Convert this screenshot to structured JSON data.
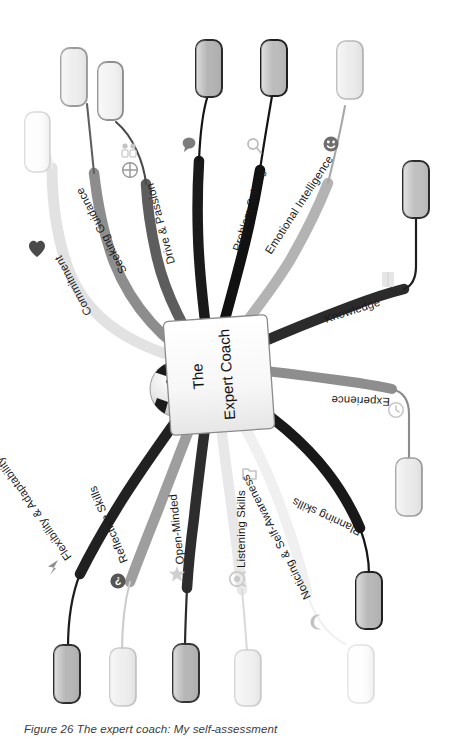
{
  "figure": {
    "caption": "Figure 26 The expert coach: My self-assessment",
    "caption_number": "Figure 26",
    "caption_text": "The expert coach: My self-assessment",
    "rotation_degrees": 90,
    "background_color": "#ffffff"
  },
  "center": {
    "title_line1": "The",
    "title_line2": "Expert Coach",
    "full_title": "The Expert Coach",
    "icon": "soccer-ball-icon",
    "fill_color": "#f4f4f4",
    "border_color": "#8a8a8a",
    "text_color": "#111111"
  },
  "branches": [
    {
      "id": "commitment",
      "label": "Commitment",
      "icon": "heart-icon",
      "icon_color": "#4a4a4a",
      "branch_color": "#e2e2e2",
      "node": {
        "fill": "#fdfdfd",
        "border": "#d8d8d8",
        "value": ""
      }
    },
    {
      "id": "seeking-guidance",
      "label": "Seeking Guidance",
      "icon": "people-group-icon",
      "icon_color": "#d0d0d0",
      "branch_color": "#8d8d8d",
      "node": {
        "fill": "#eeeeee",
        "border": "#9a9a9a",
        "value": ""
      }
    },
    {
      "id": "drive-and-passion",
      "label": "Drive & Passion",
      "icon": "target-crosshair-icon",
      "icon_color": "#9a9a9a",
      "branch_color": "#5d5d5d",
      "node": {
        "fill": "#f2f2f2",
        "border": "#8e8e8e",
        "value": ""
      }
    },
    {
      "id": "communication",
      "label": "Communication",
      "icon": "speech-bubble-icon",
      "icon_color": "#7c7c7c",
      "branch_color": "#1a1a1a",
      "node": {
        "fill": "#b4b4b4",
        "border": "#2a2a2a",
        "value": ""
      }
    },
    {
      "id": "problem-solving",
      "label": "Problem Solving",
      "icon": "magnifier-icon",
      "icon_color": "#bdbdbd",
      "branch_color": "#111111",
      "node": {
        "fill": "#bcbcbc",
        "border": "#1d1d1d",
        "value": ""
      }
    },
    {
      "id": "emotional-intelligence",
      "label": "Emotional Intelligence",
      "icon": "smiley-face-icon",
      "icon_color": "#6e6e6e",
      "branch_color": "#b3b3b3",
      "node": {
        "fill": "#ececec",
        "border": "#b6b6b6",
        "value": ""
      }
    },
    {
      "id": "knowledge",
      "label": "Knowledge",
      "icon": "book-icon",
      "icon_color": "#e0e0e0",
      "branch_color": "#2b2b2b",
      "node": {
        "fill": "#c0c0c0",
        "border": "#2b2b2b",
        "value": ""
      }
    },
    {
      "id": "experience",
      "label": "Experience",
      "icon": "clock-icon",
      "icon_color": "#c9c9c9",
      "branch_color": "#8e8e8e",
      "node": {
        "fill": "#ebebeb",
        "border": "#9d9d9d",
        "value": ""
      }
    },
    {
      "id": "planning-skills",
      "label": "Planning skills",
      "icon": "folder-icon",
      "icon_color": "#c4c4c4",
      "branch_color": "#181818",
      "node": {
        "fill": "#b8b8b8",
        "border": "#1f1f1f",
        "value": ""
      }
    },
    {
      "id": "noticing-and-self-awareness",
      "label": "Noticing & Self-Awareness",
      "icon": "moon-icon",
      "icon_color": "#c2c2c2",
      "branch_color": "#f0f0f0",
      "node": {
        "fill": "#fefefe",
        "border": "#e2e2e2",
        "value": ""
      }
    },
    {
      "id": "listening-skills",
      "label": "Listening Skills",
      "icon": "ear-listening-icon",
      "icon_color": "#c9c9c9",
      "branch_color": "#e8e8e8",
      "node": {
        "fill": "#f1f1f1",
        "border": "#cfcfcf",
        "value": ""
      }
    },
    {
      "id": "open-minded",
      "label": "Open-Minded",
      "icon": "star-icon",
      "icon_color": "#cfcfcf",
      "branch_color": "#2d2d2d",
      "node": {
        "fill": "#b6b6b6",
        "border": "#333333",
        "value": ""
      }
    },
    {
      "id": "reflective-skills",
      "label": "Reflective Skills",
      "icon": "question-mark-circle-icon",
      "icon_color": "#565656",
      "branch_color": "#9e9e9e",
      "node": {
        "fill": "#eeeeee",
        "border": "#c6c6c6",
        "value": ""
      }
    },
    {
      "id": "flexibility-and-adaptability",
      "label": "Flexibility & Adaptability",
      "icon": "arrow-triangle-icon",
      "icon_color": "#8f8f8f",
      "branch_color": "#212121",
      "node": {
        "fill": "#b7b7b7",
        "border": "#2c2c2c",
        "value": ""
      }
    }
  ]
}
